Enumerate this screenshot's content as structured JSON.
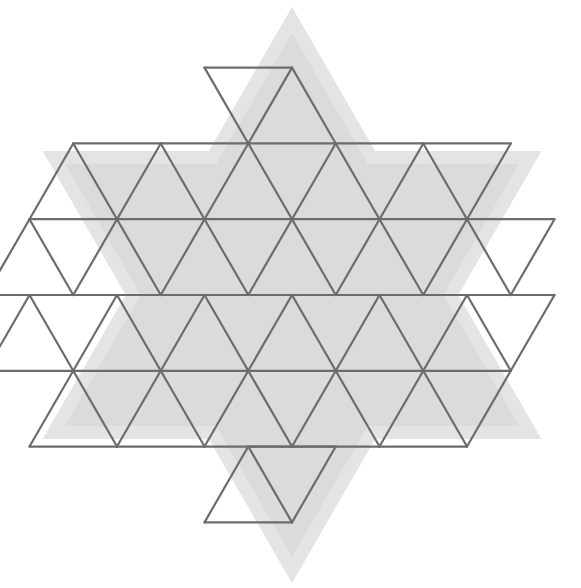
{
  "figure": {
    "title": "Triangular tiling of a hexagram",
    "kind": "geometric-tiling-diagram",
    "canvas": {
      "width": 581,
      "height": 588,
      "background": "#ffffff"
    },
    "colors": {
      "outer_fill": "#e4e4e4",
      "inner_fill": "#dbdbdb",
      "grid_line": "#6c6c6c",
      "background": "#ffffff"
    },
    "geometry": {
      "center": {
        "x": 292,
        "y": 295
      },
      "triangle_edge_px": 87.5,
      "grid_row_height_px": 75.8,
      "grid_hexagram_points": 6,
      "grid_outer_radius_px": 219,
      "outer_shape": "hexagram",
      "outer_shape_outer_radius_px": 288,
      "outer_shape_inner_radius_px": 262,
      "grid_line_width_px": 2.2
    },
    "counts": {
      "triangles_total": 36,
      "up_triangles": 18,
      "down_triangles": 18,
      "star_points": 6,
      "inner_hexagon_triangles": 24
    },
    "labels": {
      "outer_layer": "outer-star-layer",
      "inner_layer": "inner-star-layer",
      "grid_layer": "triangle-grid-layer"
    }
  },
  "chart_data": {
    "type": "diagram",
    "series": [
      {
        "name": "row-1-top-point",
        "triangle_count": 2,
        "orientation": [
          "down",
          "down"
        ],
        "y_top": 62,
        "y_bottom": 138
      },
      {
        "name": "row-2",
        "triangle_count": 10,
        "orientation": [
          "up",
          "down",
          "up",
          "down",
          "up",
          "down",
          "up",
          "down",
          "up",
          "down"
        ],
        "y_top": 138,
        "y_bottom": 216
      },
      {
        "name": "row-3",
        "triangle_count": 12,
        "orientation": [
          "up",
          "down",
          "up",
          "down",
          "up",
          "down",
          "up",
          "down",
          "up",
          "down",
          "up",
          "down"
        ],
        "y_top": 216,
        "y_bottom": 295
      },
      {
        "name": "row-4",
        "triangle_count": 12,
        "orientation": [
          "up",
          "down",
          "up",
          "down",
          "up",
          "down",
          "up",
          "down",
          "up",
          "down",
          "up",
          "down"
        ],
        "y_top": 295,
        "y_bottom": 371
      },
      {
        "name": "row-5",
        "triangle_count": 10,
        "orientation": [
          "up",
          "down",
          "up",
          "down",
          "up",
          "down",
          "up",
          "down",
          "up",
          "down"
        ],
        "y_top": 371,
        "y_bottom": 447
      },
      {
        "name": "row-6-bottom-point",
        "triangle_count": 2,
        "orientation": [
          "up",
          "up"
        ],
        "y_top": 447,
        "y_bottom": 523
      }
    ],
    "grid": false,
    "legend": false,
    "xlabel": "",
    "ylabel": ""
  }
}
